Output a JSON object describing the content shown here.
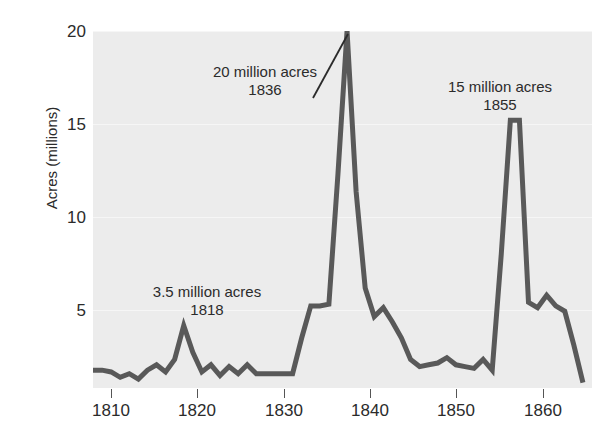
{
  "chart_data": {
    "type": "line",
    "title": "",
    "xlabel": "",
    "ylabel": "Acres (millions)",
    "xlim": [
      1808,
      1863
    ],
    "ylim": [
      0,
      20
    ],
    "grid": true,
    "legend": "none",
    "x_ticks": [
      1810,
      1820,
      1830,
      1840,
      1850,
      1860
    ],
    "x_tick_labels": [
      "1810",
      "1820",
      "1830",
      "1840",
      "1850",
      "1860"
    ],
    "y_ticks": [
      5,
      10,
      15,
      20
    ],
    "y_tick_labels": [
      "5",
      "10",
      "15",
      "20"
    ],
    "line_color": "#595959",
    "panel_color": "#ececec",
    "series": [
      {
        "name": "Public land sales",
        "x": [
          1808,
          1809,
          1810,
          1811,
          1812,
          1813,
          1814,
          1815,
          1816,
          1817,
          1818,
          1819,
          1820,
          1821,
          1822,
          1823,
          1824,
          1825,
          1826,
          1827,
          1828,
          1829,
          1830,
          1831,
          1832,
          1833,
          1834,
          1835,
          1836,
          1837,
          1838,
          1839,
          1840,
          1841,
          1842,
          1843,
          1844,
          1845,
          1846,
          1847,
          1848,
          1849,
          1850,
          1851,
          1852,
          1853,
          1854,
          1855,
          1856,
          1857,
          1858,
          1859,
          1860,
          1861,
          1862
        ],
        "y": [
          1.0,
          1.0,
          0.9,
          0.6,
          0.8,
          0.5,
          1.0,
          1.3,
          0.9,
          1.6,
          3.5,
          2.0,
          0.9,
          1.3,
          0.7,
          1.2,
          0.8,
          1.3,
          0.8,
          0.8,
          0.8,
          0.8,
          0.8,
          2.8,
          4.6,
          4.6,
          4.7,
          12.0,
          20.0,
          11.0,
          5.6,
          4.0,
          4.5,
          3.7,
          2.8,
          1.6,
          1.2,
          1.3,
          1.4,
          1.7,
          1.3,
          1.2,
          1.1,
          1.6,
          1.0,
          7.5,
          15.0,
          15.0,
          4.8,
          4.5,
          5.2,
          4.6,
          4.3,
          2.4,
          0.3
        ]
      }
    ],
    "annotations": [
      {
        "id": "ann-1818",
        "line1": "3.5 million acres",
        "line2": "1818",
        "value": 3.5,
        "year": 1818,
        "leader": false
      },
      {
        "id": "ann-1836",
        "line1": "20 million acres",
        "line2": "1836",
        "value": 20,
        "year": 1836,
        "leader": true
      },
      {
        "id": "ann-1855",
        "line1": "15 million acres",
        "line2": "1855",
        "value": 15,
        "year": 1855,
        "leader": false
      }
    ]
  }
}
